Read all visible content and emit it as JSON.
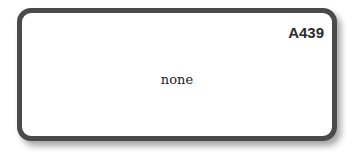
{
  "card": {
    "code": "A439",
    "value": "none"
  }
}
